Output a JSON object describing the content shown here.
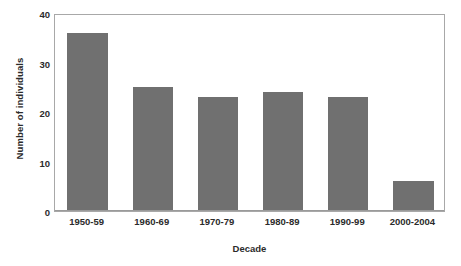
{
  "chart_data": {
    "type": "bar",
    "title": "",
    "xlabel": "Decade",
    "ylabel": "Number of individuals",
    "categories": [
      "1950-59",
      "1960-69",
      "1970-79",
      "1980-89",
      "1990-99",
      "2000-2004"
    ],
    "values": [
      36,
      25,
      23,
      24,
      23,
      6
    ],
    "series": [
      {
        "name": "Number of individuals",
        "values": [
          36,
          25,
          23,
          24,
          23,
          6
        ]
      }
    ],
    "ylim": [
      0,
      40
    ],
    "yticks": [
      0,
      10,
      20,
      30,
      40
    ],
    "ytick_labels": [
      "0",
      "10",
      "20",
      "30",
      "40"
    ],
    "grid": false,
    "legend": false,
    "legend_position": "none",
    "bar_color": "#707070",
    "frame_color": "#a8a8a8",
    "background_color": "#ffffff",
    "text_color": "#2b2b2b"
  }
}
